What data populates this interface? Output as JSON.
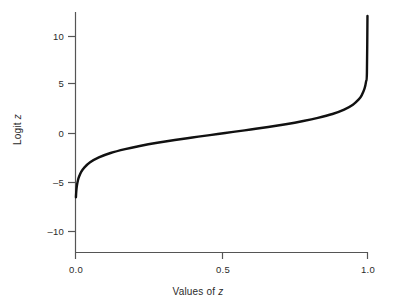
{
  "figure": {
    "background": "#ffffff",
    "ink_color": "#111111",
    "axis_color": "#555555"
  },
  "chart_data": {
    "type": "line",
    "title": "",
    "xlabel": "Values of z",
    "xlabel_plain": "Values of",
    "xlabel_italic": "z",
    "ylabel": "Logit z",
    "ylabel_plain": "Logit",
    "ylabel_italic": "z",
    "xlim": [
      0.0,
      1.0
    ],
    "ylim": [
      -12.5,
      12.5
    ],
    "xticks": [
      0.0,
      0.5,
      1.0
    ],
    "xtick_labels": [
      "0.0",
      "0.5",
      "1.0"
    ],
    "yticks": [
      10,
      5,
      0,
      -5,
      -10
    ],
    "ytick_labels": [
      "10",
      "5",
      "0",
      "–10",
      "–5"
    ],
    "ytick_labels_ordered": [
      "10",
      "5",
      "0",
      "–5",
      "–10"
    ],
    "grid": false,
    "legend": false,
    "series": [
      {
        "name": "logit(z) = ln(z / (1 - z))",
        "color": "#111111",
        "linewidth": 2.4,
        "x": [
          0.0015,
          0.002,
          0.003,
          0.005,
          0.008,
          0.012,
          0.02,
          0.03,
          0.05,
          0.08,
          0.12,
          0.17,
          0.22,
          0.28,
          0.34,
          0.4,
          0.46,
          0.5,
          0.54,
          0.6,
          0.66,
          0.72,
          0.78,
          0.83,
          0.88,
          0.92,
          0.95,
          0.97,
          0.98,
          0.99,
          0.995,
          0.998,
          0.9999
        ],
        "y": [
          -6.5,
          -6.21,
          -5.81,
          -5.29,
          -4.82,
          -4.41,
          -3.89,
          -3.48,
          -2.94,
          -2.44,
          -1.99,
          -1.59,
          -1.27,
          -0.94,
          -0.66,
          -0.41,
          -0.16,
          0.0,
          0.16,
          0.41,
          0.66,
          0.94,
          1.27,
          1.59,
          1.99,
          2.44,
          2.94,
          3.48,
          3.89,
          4.6,
          5.29,
          6.21,
          12.0
        ]
      }
    ],
    "annotations": []
  },
  "axes": {
    "y_axis_label": "Logit z",
    "x_axis_label": "Values of z"
  }
}
